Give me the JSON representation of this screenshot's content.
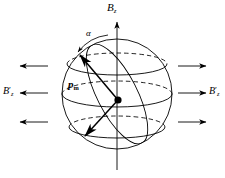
{
  "figure": {
    "background_color": "#ffffff",
    "stroke_color": "#000000",
    "width": 225,
    "height": 178
  },
  "labels": {
    "axis_field": {
      "base": "B",
      "subscript": "z",
      "prime": ""
    },
    "field_left": {
      "base": "B",
      "subscript": "z",
      "prime": "′"
    },
    "field_right": {
      "base": "B",
      "subscript": "z",
      "prime": "′"
    },
    "angle": {
      "symbol": "α"
    },
    "moment": {
      "base": "p",
      "subscript": "m",
      "prime": ""
    }
  },
  "elements": {
    "sphere": {
      "name": "sphere-outline",
      "center_x": 117,
      "center_y": 94,
      "radius": 55
    },
    "center_dot": {
      "name": "origin-dot",
      "x": 118,
      "y": 100,
      "radius": 3.4
    },
    "axis": {
      "name": "vertical-axis",
      "x": 117,
      "top_y": 18,
      "bottom_y": 170,
      "arrow": "up"
    },
    "latitude_circles": [
      {
        "name": "latitude-circle-upper",
        "cy": 64,
        "rx": 50,
        "ry": 11
      },
      {
        "name": "latitude-circle-equator",
        "cy": 94,
        "rx": 55,
        "ry": 13
      },
      {
        "name": "latitude-circle-lower",
        "cy": 127,
        "rx": 48,
        "ry": 11
      }
    ],
    "meridian": {
      "name": "tilted-meridian",
      "description": "tilted great-circle through moment vector"
    },
    "moment_vector_up": {
      "name": "moment-vector-up",
      "from_x": 118,
      "from_y": 100,
      "to_x": 78,
      "to_y": 53
    },
    "moment_vector_down": {
      "name": "moment-vector-down",
      "from_x": 118,
      "from_y": 100,
      "to_x": 83,
      "to_y": 139
    },
    "angle_arc": {
      "name": "angle-arc-alpha",
      "description": "arc between vertical axis and moment vector"
    },
    "field_arrows_left": [
      {
        "name": "field-arrow-left-top",
        "y": 66,
        "x_start": 48,
        "x_end": 18
      },
      {
        "name": "field-arrow-left-middle",
        "y": 93,
        "x_start": 48,
        "x_end": 18
      },
      {
        "name": "field-arrow-left-bottom",
        "y": 122,
        "x_start": 48,
        "x_end": 18
      }
    ],
    "field_arrows_right": [
      {
        "name": "field-arrow-right-top",
        "y": 66,
        "x_start": 178,
        "x_end": 208
      },
      {
        "name": "field-arrow-right-middle",
        "y": 93,
        "x_start": 178,
        "x_end": 208
      },
      {
        "name": "field-arrow-right-bottom",
        "y": 122,
        "x_start": 178,
        "x_end": 208
      }
    ]
  }
}
